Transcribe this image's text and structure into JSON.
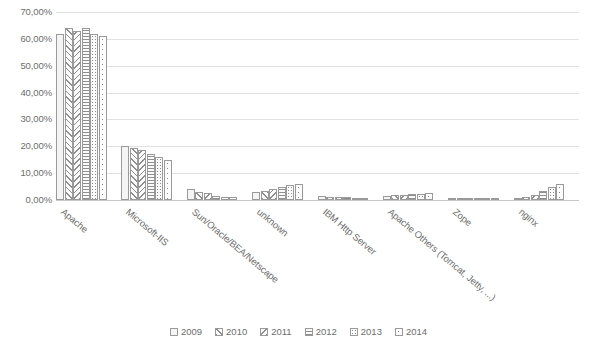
{
  "chart_data": {
    "type": "bar",
    "title": "",
    "xlabel": "",
    "ylabel": "",
    "ylim": [
      0,
      70
    ],
    "grid": true,
    "legend_position": "bottom",
    "ytick_labels": [
      "70,00%",
      "60,00%",
      "50,00%",
      "40,00%",
      "30,00%",
      "20,00%",
      "10,00%",
      "0,00%"
    ],
    "ytick_values": [
      70,
      60,
      50,
      40,
      30,
      20,
      10,
      0
    ],
    "categories": [
      "Apache",
      "Microsoft-IIS",
      "Sun/Oracle/BEA/Netscape",
      "unknown",
      "IBM Http Server",
      "Apache Others (Tomcat, Jetty, ...)",
      "Zope",
      "nginx"
    ],
    "series": [
      {
        "name": "2009",
        "pattern": "plain",
        "values": [
          62.0,
          20.2,
          4.0,
          3.0,
          1.5,
          1.5,
          0.5,
          0.3
        ]
      },
      {
        "name": "2010",
        "pattern": "diagonal-up",
        "values": [
          64.0,
          19.5,
          3.0,
          3.5,
          1.3,
          1.8,
          0.5,
          1.0
        ]
      },
      {
        "name": "2011",
        "pattern": "diagonal-down",
        "values": [
          63.0,
          18.5,
          2.5,
          4.0,
          1.2,
          2.0,
          0.5,
          2.0
        ]
      },
      {
        "name": "2012",
        "pattern": "horizontal",
        "values": [
          64.0,
          17.0,
          1.5,
          5.0,
          1.0,
          2.2,
          0.4,
          3.5
        ]
      },
      {
        "name": "2013",
        "pattern": "dots-dense",
        "values": [
          62.0,
          16.0,
          1.2,
          5.5,
          0.8,
          2.4,
          0.4,
          5.0
        ]
      },
      {
        "name": "2014",
        "pattern": "dots-sparse",
        "values": [
          61.0,
          15.0,
          1.0,
          6.0,
          0.7,
          2.5,
          0.4,
          6.0
        ]
      }
    ]
  }
}
